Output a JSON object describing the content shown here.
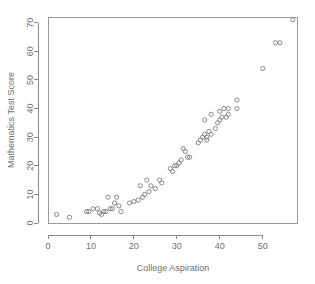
{
  "chart_data": {
    "type": "scatter",
    "title": "",
    "xlabel": "College Aspiration",
    "ylabel": "Mathematics Test Score",
    "xlim": [
      0,
      58
    ],
    "ylim": [
      0,
      72
    ],
    "xticks": [
      0,
      10,
      20,
      30,
      40,
      50
    ],
    "yticks": [
      0,
      10,
      20,
      30,
      40,
      50,
      60,
      70
    ],
    "xtick_labels": [
      "0",
      "10",
      "20",
      "30",
      "40",
      "50"
    ],
    "ytick_labels": [
      "0",
      "10",
      "20",
      "30",
      "40",
      "50",
      "60",
      "70"
    ],
    "grid": false,
    "legend": null,
    "marker": "open-circle",
    "marker_color": "#7d7d7d",
    "points": [
      [
        2,
        3
      ],
      [
        5,
        2
      ],
      [
        9,
        4
      ],
      [
        9.5,
        4
      ],
      [
        10.5,
        5
      ],
      [
        11.5,
        5
      ],
      [
        12,
        3.5
      ],
      [
        12.5,
        3
      ],
      [
        13,
        4
      ],
      [
        13.5,
        4
      ],
      [
        14,
        9
      ],
      [
        14.5,
        5
      ],
      [
        15,
        5
      ],
      [
        15.5,
        7
      ],
      [
        16,
        9
      ],
      [
        16.5,
        6
      ],
      [
        17,
        4
      ],
      [
        19,
        7
      ],
      [
        20,
        7.5
      ],
      [
        21,
        8
      ],
      [
        21.5,
        13
      ],
      [
        22,
        9
      ],
      [
        22.5,
        10
      ],
      [
        23,
        15
      ],
      [
        23.5,
        11
      ],
      [
        24,
        13
      ],
      [
        25,
        12
      ],
      [
        26,
        15
      ],
      [
        26.5,
        14
      ],
      [
        28.5,
        19
      ],
      [
        29,
        18
      ],
      [
        29.5,
        20
      ],
      [
        30,
        20
      ],
      [
        30.5,
        21
      ],
      [
        31,
        22
      ],
      [
        31.5,
        26
      ],
      [
        32,
        25
      ],
      [
        32.5,
        23
      ],
      [
        33,
        23
      ],
      [
        35,
        28
      ],
      [
        35.5,
        29
      ],
      [
        36,
        30
      ],
      [
        36.5,
        31
      ],
      [
        36.5,
        36
      ],
      [
        37,
        30
      ],
      [
        37,
        29
      ],
      [
        37.5,
        32
      ],
      [
        38,
        31
      ],
      [
        38,
        38
      ],
      [
        39,
        33
      ],
      [
        39.5,
        35
      ],
      [
        40,
        39
      ],
      [
        40,
        36
      ],
      [
        40.5,
        37
      ],
      [
        41,
        40
      ],
      [
        41.5,
        37
      ],
      [
        42,
        38
      ],
      [
        42,
        40
      ],
      [
        44,
        43
      ],
      [
        44,
        40
      ],
      [
        50,
        54
      ],
      [
        53,
        63
      ],
      [
        54,
        63
      ],
      [
        57,
        71
      ]
    ]
  }
}
